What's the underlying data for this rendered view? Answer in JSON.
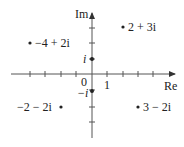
{
  "diagram": {
    "axes": {
      "real_label": "Re",
      "imag_label": "Im",
      "origin_label": "0",
      "unit_label": "1",
      "x_range": [
        -4,
        5
      ],
      "y_range": [
        -4,
        4
      ]
    },
    "axis_markers": [
      {
        "label": "i",
        "re": 0,
        "im": 1
      },
      {
        "label": "−i",
        "re": 0,
        "im": -1
      }
    ],
    "points": [
      {
        "label": "2 + 3i",
        "re": 2,
        "im": 3
      },
      {
        "label": "−4 + 2i",
        "re": -4,
        "im": 2
      },
      {
        "label": "−2 − 2i",
        "re": -2,
        "im": -2
      },
      {
        "label": "3 − 2i",
        "re": 3,
        "im": -2
      }
    ],
    "colors": {
      "stroke": "#333333",
      "text": "#222222"
    }
  }
}
